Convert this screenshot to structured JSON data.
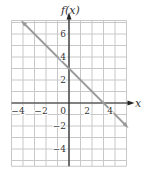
{
  "chart_data": {
    "type": "line",
    "title": "",
    "xlabel": "x",
    "ylabel": "f(x)",
    "xlim": [
      -5,
      5
    ],
    "ylim": [
      -5.5,
      7
    ],
    "grid": true,
    "x_ticks": [
      -4,
      -2,
      0,
      2,
      4
    ],
    "y_ticks": [
      -4,
      -2,
      2,
      4,
      6
    ],
    "x_tick_labels": [
      "−4",
      "−2",
      "0",
      "2",
      "4"
    ],
    "y_tick_labels": [
      "−4",
      "−2",
      "2",
      "4",
      "6"
    ],
    "series": [
      {
        "name": "f(x) = −x + 3",
        "x": [
          -4,
          5
        ],
        "y": [
          7,
          -2
        ],
        "color": "#9a9a9a"
      }
    ]
  },
  "labels": {
    "xlabel": "x",
    "ylabel": "f(x)"
  },
  "colors": {
    "grid": "#c8c8c8",
    "axis": "#222222",
    "line": "#9a9a9a"
  }
}
